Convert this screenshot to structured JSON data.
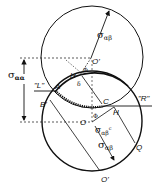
{
  "diagram": {
    "type": "mohr-circle-construction",
    "labels": {
      "sigma_aa": "σ",
      "sigma_aa_sub": "αα",
      "sigma_ab_top": "σ",
      "sigma_ab_top_sub": "αβ",
      "sigma_ab_bottom": "σ",
      "sigma_ab_bottom_sub": "αβ",
      "sigma_abc": "σ",
      "sigma_abc_sub": "αβ",
      "sigma_abc_sup": "c",
      "L": "\"L\"",
      "R": "\"R\"",
      "A": "A",
      "B_prime": "B'",
      "C": "C",
      "H_upper": "H",
      "H_lower": "H",
      "O": "O",
      "O_prime_upper": "O'",
      "O_prime_lower": "O'",
      "Q": "Q",
      "delta": "δ",
      "phi_upper": "Φ",
      "phi_lower": "Φ"
    },
    "colors": {
      "stroke": "#111111",
      "background": "#ffffff"
    }
  }
}
